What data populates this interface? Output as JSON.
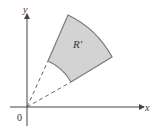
{
  "diagram": {
    "region_label": "R′",
    "x_axis_label": "x",
    "y_axis_label": "y",
    "origin_label": "0",
    "colors": {
      "region_fill": "#d3d3d3",
      "region_stroke": "#7a7a7a",
      "axis": "#444444",
      "dashed": "#555555"
    }
  }
}
